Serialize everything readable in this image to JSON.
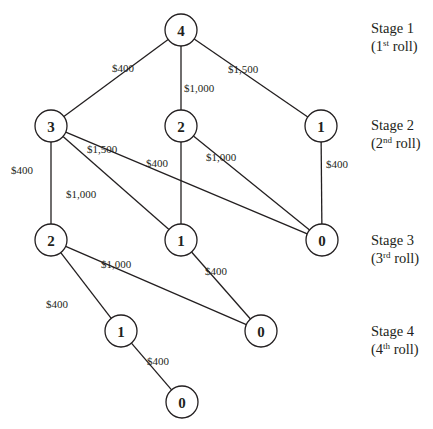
{
  "diagram": {
    "type": "stage network / decision tree",
    "colors": {
      "line": "#231f20",
      "node_fill": "#ffffff",
      "background": "#ffffff"
    },
    "node_radius": 16,
    "nodes": [
      {
        "id": "s1_4",
        "label": "4",
        "x": 181,
        "y": 30
      },
      {
        "id": "s2_3",
        "label": "3",
        "x": 51,
        "y": 126
      },
      {
        "id": "s2_2",
        "label": "2",
        "x": 181,
        "y": 126
      },
      {
        "id": "s2_1",
        "label": "1",
        "x": 321,
        "y": 126
      },
      {
        "id": "s3_2",
        "label": "2",
        "x": 51,
        "y": 240
      },
      {
        "id": "s3_1",
        "label": "1",
        "x": 181,
        "y": 240
      },
      {
        "id": "s3_0",
        "label": "0",
        "x": 322,
        "y": 240
      },
      {
        "id": "s4_1",
        "label": "1",
        "x": 121,
        "y": 331
      },
      {
        "id": "s4_0",
        "label": "0",
        "x": 261,
        "y": 331
      },
      {
        "id": "s5_0",
        "label": "0",
        "x": 182,
        "y": 402
      }
    ],
    "edges": [
      {
        "from": "s1_4",
        "to": "s2_3",
        "label": "$400",
        "lx": 112,
        "ly": 63
      },
      {
        "from": "s1_4",
        "to": "s2_2",
        "label": "$1,000",
        "lx": 184,
        "ly": 83
      },
      {
        "from": "s1_4",
        "to": "s2_1",
        "label": "$1,500",
        "lx": 228,
        "ly": 64
      },
      {
        "from": "s2_3",
        "to": "s3_2",
        "label": "$400",
        "lx": 11,
        "ly": 165
      },
      {
        "from": "s2_3",
        "to": "s3_1",
        "label": "$1,000",
        "lx": 66,
        "ly": 189
      },
      {
        "from": "s2_3",
        "to": "s3_0",
        "label": "$1,500",
        "lx": 87,
        "ly": 144
      },
      {
        "from": "s2_2",
        "to": "s3_1",
        "label": "$400",
        "lx": 146,
        "ly": 158
      },
      {
        "from": "s2_2",
        "to": "s3_0",
        "label": "$1,000",
        "lx": 206,
        "ly": 152
      },
      {
        "from": "s2_1",
        "to": "s3_0",
        "label": "$400",
        "lx": 326,
        "ly": 159
      },
      {
        "from": "s3_2",
        "to": "s4_1",
        "label": "$400",
        "lx": 46,
        "ly": 299
      },
      {
        "from": "s3_2",
        "to": "s4_0",
        "label": "$1,000",
        "lx": 101,
        "ly": 259
      },
      {
        "from": "s3_1",
        "to": "s4_0",
        "label": "$400",
        "lx": 205,
        "ly": 266
      },
      {
        "from": "s4_1",
        "to": "s5_0",
        "label": "$400",
        "lx": 147,
        "ly": 356
      }
    ],
    "stages": [
      {
        "title": "Stage 1",
        "ordinal_num": "(1",
        "ordinal_sup": "st",
        "ordinal_rest": " roll)",
        "x": 371,
        "y": 19
      },
      {
        "title": "Stage 2",
        "ordinal_num": "(2",
        "ordinal_sup": "nd",
        "ordinal_rest": " roll)",
        "x": 371,
        "y": 116
      },
      {
        "title": "Stage 3",
        "ordinal_num": "(3",
        "ordinal_sup": "rd",
        "ordinal_rest": " roll)",
        "x": 371,
        "y": 231
      },
      {
        "title": "Stage 4",
        "ordinal_num": "(4",
        "ordinal_sup": "th",
        "ordinal_rest": " roll)",
        "x": 371,
        "y": 322
      }
    ]
  }
}
